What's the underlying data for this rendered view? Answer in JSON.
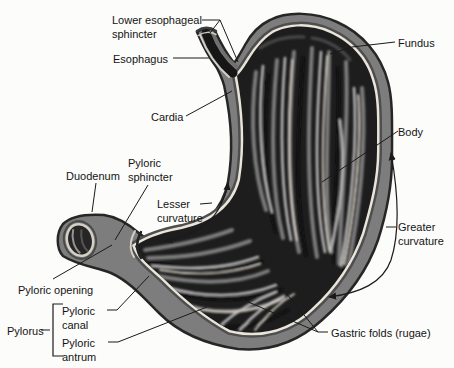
{
  "labels": {
    "lower_esophageal_sphincter": "Lower esophageal\nsphincter",
    "esophagus": "Esophagus",
    "cardia": "Cardia",
    "fundus": "Fundus",
    "body": "Body",
    "duodenum": "Duodenum",
    "pyloric_sphincter": "Pyloric\nsphincter",
    "lesser_curvature": "Lesser\ncurvature",
    "greater_curvature": "Greater\ncurvature",
    "pyloric_opening": "Pyloric opening",
    "pylorus": "Pylorus",
    "pyloric_canal": "Pyloric\ncanal",
    "pyloric_antrum": "Pyloric\nantrum",
    "gastric_folds": "Gastric folds (rugae)"
  },
  "colors": {
    "ink": "#1a1a1a",
    "wall_gray": "#7d7d7d",
    "muscle_dark": "#4e4e4e",
    "inner_lining_cream": "#e9e5da",
    "interior_dark": "#1d1d1d",
    "background": "#fcfcfa"
  }
}
